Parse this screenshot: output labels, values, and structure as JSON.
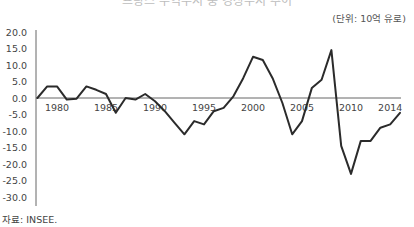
{
  "title": "프랑스 무역수지 중 경상수지 추이",
  "unit_label": "(단위: 10억 유로)",
  "source_label": "자료: INSEE.",
  "colors": {
    "line": "#2b2b2b",
    "axis": "#666666",
    "text": "#444444"
  },
  "chart_data": {
    "type": "line",
    "title": "",
    "xlabel": "",
    "ylabel": "(단위: 10억 유로)",
    "ylim": [
      -30,
      20
    ],
    "yticks": [
      "20.0",
      "15.0",
      "10.0",
      "5.0",
      "0.0",
      "-5.0",
      "-10.0",
      "-15.0",
      "-20.0",
      "-25.0",
      "-30.0"
    ],
    "xticks": [
      "1980",
      "1985",
      "1990",
      "1995",
      "2000",
      "2005",
      "2010",
      "2014"
    ],
    "grid": false,
    "legend": null,
    "x": [
      1978,
      1979,
      1980,
      1981,
      1982,
      1983,
      1984,
      1985,
      1986,
      1987,
      1988,
      1989,
      1990,
      1991,
      1992,
      1993,
      1994,
      1995,
      1996,
      1997,
      1998,
      1999,
      2000,
      2001,
      2002,
      2003,
      2004,
      2005,
      2006,
      2007,
      2008,
      2009,
      2010,
      2011,
      2012,
      2013,
      2014,
      2015
    ],
    "series": [
      {
        "name": "경상수지",
        "values": [
          0.0,
          3.5,
          3.5,
          -0.5,
          -0.2,
          3.5,
          2.5,
          1.2,
          -4.5,
          0.0,
          -0.5,
          1.2,
          -1.0,
          -4.0,
          -7.5,
          -11.0,
          -7.0,
          -8.0,
          -4.0,
          -3.0,
          0.5,
          6.0,
          12.5,
          11.5,
          6.0,
          -1.5,
          -11.0,
          -7.0,
          3.0,
          5.5,
          14.5,
          -14.5,
          -23.0,
          -13.0,
          -13.0,
          -9.0,
          -8.0,
          -4.5
        ]
      }
    ]
  }
}
